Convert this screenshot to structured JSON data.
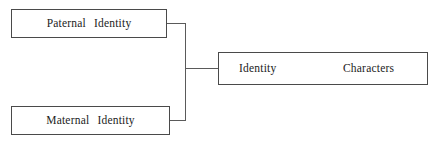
{
  "diagram": {
    "type": "tree-merge",
    "background_color": "#ffffff",
    "line_color": "#5a5a5a",
    "border_color": "#4a4a4a",
    "text_color": "#1c1c1c",
    "nodes": {
      "paternal": {
        "label": "Paternal  Identity"
      },
      "maternal": {
        "label": "Maternal  Identity"
      },
      "result": {
        "label_primary": "Identity",
        "label_secondary": "Characters"
      }
    },
    "connectors": [
      {
        "name": "paternal-stub",
        "orientation": "horizontal"
      },
      {
        "name": "maternal-stub",
        "orientation": "horizontal"
      },
      {
        "name": "trunk",
        "orientation": "vertical"
      },
      {
        "name": "result-stub",
        "orientation": "horizontal"
      }
    ]
  }
}
